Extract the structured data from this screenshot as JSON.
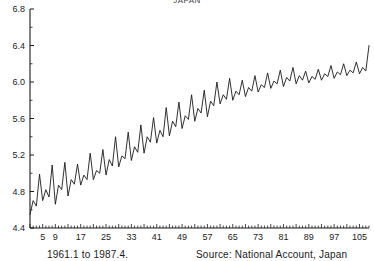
{
  "figure": {
    "title": "JAPAN",
    "period_note": "1961.1 to 1987.4.",
    "source_note": "Source: National Account, Japan",
    "line_color": "#1a1a1a",
    "axis_color": "#1a1a1a",
    "background": "#ffffff"
  },
  "chart_data": {
    "type": "line",
    "title": "JAPAN",
    "subtitle": "",
    "xlabel": "",
    "ylabel": "",
    "xlim": [
      1,
      108
    ],
    "ylim": [
      4.4,
      6.8
    ],
    "ytick_labels": [
      "4.4",
      "4.8",
      "5.2",
      "5.6",
      "6.0",
      "6.4",
      "6.8"
    ],
    "ytick_values": [
      4.4,
      4.8,
      5.2,
      5.6,
      6.0,
      6.4,
      6.8
    ],
    "xtick_labels": [
      "5",
      "9",
      "17",
      "25",
      "33",
      "41",
      "49",
      "57",
      "65",
      "73",
      "81",
      "89",
      "97",
      "105"
    ],
    "xtick_values": [
      5,
      9,
      17,
      25,
      33,
      41,
      49,
      57,
      65,
      73,
      81,
      89,
      97,
      105
    ],
    "minor_xticks_every": 1,
    "grid": false,
    "legend": "none",
    "annotations": [
      "1961.1 to 1987.4.",
      "Source: National Account, Japan"
    ],
    "series": [
      {
        "name": "JAPAN",
        "color": "#1a1a1a",
        "x": [
          1,
          2,
          3,
          4,
          5,
          6,
          7,
          8,
          9,
          10,
          11,
          12,
          13,
          14,
          15,
          16,
          17,
          18,
          19,
          20,
          21,
          22,
          23,
          24,
          25,
          26,
          27,
          28,
          29,
          30,
          31,
          32,
          33,
          34,
          35,
          36,
          37,
          38,
          39,
          40,
          41,
          42,
          43,
          44,
          45,
          46,
          47,
          48,
          49,
          50,
          51,
          52,
          53,
          54,
          55,
          56,
          57,
          58,
          59,
          60,
          61,
          62,
          63,
          64,
          65,
          66,
          67,
          68,
          69,
          70,
          71,
          72,
          73,
          74,
          75,
          76,
          77,
          78,
          79,
          80,
          81,
          82,
          83,
          84,
          85,
          86,
          87,
          88,
          89,
          90,
          91,
          92,
          93,
          94,
          95,
          96,
          97,
          98,
          99,
          100,
          101,
          102,
          103,
          104,
          105,
          106,
          107,
          108
        ],
        "values": [
          4.55,
          4.7,
          4.64,
          4.99,
          4.7,
          4.82,
          4.74,
          5.09,
          4.66,
          4.87,
          4.82,
          5.12,
          4.75,
          4.93,
          4.88,
          5.1,
          4.87,
          4.98,
          4.93,
          5.22,
          4.93,
          5.03,
          5.0,
          5.26,
          4.98,
          5.15,
          5.08,
          5.4,
          5.07,
          5.19,
          5.16,
          5.45,
          5.14,
          5.29,
          5.23,
          5.53,
          5.22,
          5.4,
          5.34,
          5.61,
          5.33,
          5.47,
          5.4,
          5.72,
          5.41,
          5.57,
          5.51,
          5.78,
          5.49,
          5.63,
          5.59,
          5.86,
          5.57,
          5.71,
          5.66,
          5.91,
          5.62,
          5.79,
          5.74,
          6.0,
          5.76,
          5.86,
          5.81,
          6.04,
          5.8,
          5.9,
          5.86,
          6.02,
          5.84,
          5.94,
          5.9,
          6.07,
          5.89,
          5.97,
          5.94,
          6.1,
          5.93,
          6.01,
          5.98,
          6.13,
          5.95,
          6.05,
          6.01,
          6.16,
          5.98,
          6.07,
          6.02,
          6.12,
          5.99,
          6.06,
          6.03,
          6.14,
          6.02,
          6.09,
          6.06,
          6.18,
          6.04,
          6.11,
          6.08,
          6.2,
          6.07,
          6.13,
          6.1,
          6.22,
          6.09,
          6.16,
          6.12,
          6.4
        ]
      }
    ]
  }
}
